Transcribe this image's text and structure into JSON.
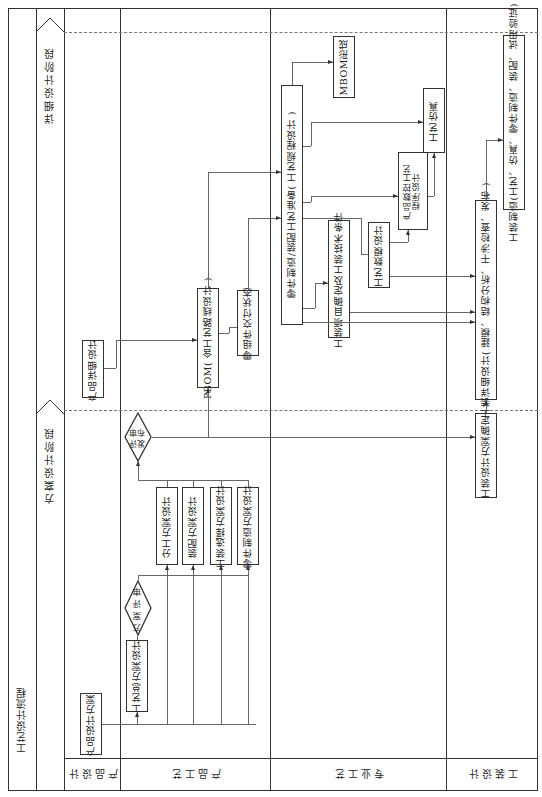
{
  "title": "工艺设计流程",
  "phases": {
    "scheme": "方案设计阶段",
    "detailed": "详细设计阶段"
  },
  "lanes": [
    {
      "id": "product-design",
      "label": "产品设计"
    },
    {
      "id": "product-process",
      "label": "产品工艺"
    },
    {
      "id": "specialty-process",
      "label": "专业工艺"
    },
    {
      "id": "tooling-design",
      "label": "工装设计"
    }
  ],
  "nodes": {
    "product_design_scheme": "产品设计方案",
    "process_overall_scheme": "工艺总方案设计",
    "scheme_review": "方案评审",
    "division_scheme": "分工方案设计",
    "assembly_scheme": "装配方案设计",
    "tooling_selection_scheme": "工装选择方案设计",
    "part_mfg_scheme": "零件制造方案设计",
    "review_release_1": "评审",
    "review_release_2": "发布",
    "product_detailed_design": "产品详细设计",
    "pbom": "PBOM( 含工艺路线设计 )",
    "parts_delivery_state": "零组件交付状态",
    "part_mfg_assembly_prep": "零件制造/装配工艺准备( 工艺规程设计 )",
    "tooling_project_confirm": "工装项目确定及工装技术条件",
    "process_digital_model": "工艺数模设计",
    "nc_program_1": "产品数控工艺",
    "nc_program_2": "程序设计",
    "process_simulation": "工艺仿真",
    "mbom": "MBOM形成",
    "tooling_scheme_confirm": "工装设计方案确定",
    "tooling_detailed_design": "工装详细设计( 建模、结构分析、干涉检查、发布 )",
    "tooling_manufacture": "工装制造(工艺、仿真、零件制造、装配、试用验证)"
  }
}
